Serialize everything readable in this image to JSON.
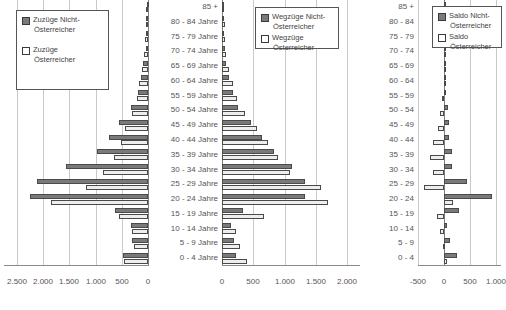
{
  "chart_data": [
    {
      "id": "zuzuege",
      "type": "bar",
      "orientation": "horizontal",
      "direction": "left",
      "title": "Zuzüge",
      "xlabel": "",
      "ylabel": "",
      "xlim": [
        0,
        2750
      ],
      "ticks": [
        2500,
        2000,
        1500,
        1000,
        500,
        0
      ],
      "ticklabels": [
        "2.500",
        "2.000",
        "1.500",
        "1.000",
        "500",
        "0"
      ],
      "grid": true,
      "legend_position": "top-left",
      "categories": [
        "85 +",
        "80 - 84 Jahre",
        "75 - 79 Jahre",
        "70 - 74 Jahre",
        "65 - 69 Jahre",
        "60 - 64 Jahre",
        "55 - 59 Jahre",
        "50 - 54 Jahre",
        "45 - 49 Jahre",
        "40 - 44 Jahre",
        "35 - 39 Jahre",
        "30 - 34 Jahre",
        "25 - 29 Jahre",
        "20 - 24 Jahre",
        "15 - 19 Jahre",
        "10 - 14 Jahre",
        "5 - 9 Jahre",
        "0 - 4 Jahre"
      ],
      "series": [
        {
          "name": "Zuzüge Nicht-Österreicher",
          "style": "dark",
          "values": [
            20,
            30,
            35,
            45,
            90,
            130,
            190,
            330,
            560,
            740,
            980,
            1560,
            2120,
            2250,
            630,
            330,
            300,
            480
          ]
        },
        {
          "name": "Zuzüge Österreicher",
          "style": "light",
          "values": [
            35,
            45,
            55,
            75,
            110,
            165,
            215,
            300,
            440,
            520,
            640,
            860,
            1190,
            1860,
            545,
            300,
            260,
            460
          ]
        }
      ]
    },
    {
      "id": "wegzuege",
      "type": "bar",
      "orientation": "horizontal",
      "direction": "right",
      "title": "Wegzüge",
      "xlabel": "",
      "ylabel": "",
      "xlim": [
        0,
        2200
      ],
      "ticks": [
        0,
        500,
        1000,
        1500,
        2000
      ],
      "ticklabels": [
        "0",
        "500",
        "1.000",
        "1.500",
        "2.000"
      ],
      "grid": true,
      "legend_position": "top-left",
      "categories": [
        "85 +",
        "80 - 84 Jahre",
        "75 - 79 Jahre",
        "70 - 74 Jahre",
        "65 - 69 Jahre",
        "60 - 64 Jahre",
        "55 - 59 Jahre",
        "50 - 54 Jahre",
        "45 - 49 Jahre",
        "40 - 44 Jahre",
        "35 - 39 Jahre",
        "30 - 34 Jahre",
        "25 - 29 Jahre",
        "20 - 24 Jahre",
        "15 - 19 Jahre",
        "10 - 14 Jahre",
        "5 - 9 Jahre",
        "0 - 4 Jahre"
      ],
      "series": [
        {
          "name": "Wegzüge Nicht-Österreicher",
          "style": "dark",
          "values": [
            15,
            25,
            30,
            40,
            70,
            110,
            170,
            260,
            460,
            640,
            830,
            1120,
            1330,
            1330,
            340,
            150,
            190,
            230
          ]
        },
        {
          "name": "Wegzüge Österreicher",
          "style": "light",
          "values": [
            30,
            40,
            50,
            70,
            105,
            175,
            245,
            370,
            560,
            740,
            900,
            1080,
            1580,
            1690,
            670,
            230,
            280,
            400
          ]
        }
      ]
    },
    {
      "id": "saldo",
      "type": "bar",
      "orientation": "horizontal",
      "direction": "right",
      "title": "Saldo",
      "xlabel": "",
      "ylabel": "",
      "xlim": [
        -500,
        1100
      ],
      "ticks": [
        -500,
        0,
        500,
        1000
      ],
      "ticklabels": [
        "-500",
        "0",
        "500",
        "1.000"
      ],
      "grid": true,
      "legend_position": "top-right",
      "categories": [
        "85 +",
        "80 - 84",
        "75 - 79",
        "70 - 74",
        "65 - 69",
        "60 - 64",
        "55 - 59",
        "50 - 54",
        "45 - 49",
        "40 - 44",
        "35 - 39",
        "30 - 34",
        "25 - 29",
        "20 - 24",
        "15 - 19",
        "10 - 14",
        "5 - 9",
        "0 - 4"
      ],
      "series": [
        {
          "name": "Saldo Nicht-Österreicher",
          "style": "dark",
          "values": [
            5,
            5,
            5,
            5,
            20,
            20,
            20,
            70,
            100,
            100,
            150,
            150,
            440,
            920,
            290,
            60,
            110,
            250
          ]
        },
        {
          "name": "Saldo Österreicher",
          "style": "light",
          "values": [
            5,
            5,
            5,
            5,
            5,
            5,
            -30,
            -70,
            -120,
            -220,
            -260,
            -220,
            -390,
            170,
            -125,
            -70,
            -20,
            60
          ]
        }
      ]
    }
  ],
  "legends": {
    "left": {
      "items": [
        {
          "style": "dark",
          "line1": "Zuzüge Nicht-",
          "line2": "Österreicher"
        },
        {
          "style": "light",
          "line1": "Zuzüge",
          "line2": "Österreicher"
        }
      ]
    },
    "middle": {
      "items": [
        {
          "style": "dark",
          "line1": "Wegzüge Nicht-",
          "line2": "Österreicher"
        },
        {
          "style": "light",
          "line1": "Wegzüge",
          "line2": "Österreicher"
        }
      ]
    },
    "right": {
      "items": [
        {
          "style": "dark",
          "line1": "Saldo Nicht-",
          "line2": "Österreicher"
        },
        {
          "style": "light",
          "line1": "Saldo",
          "line2": "Österreicher"
        }
      ]
    }
  },
  "colors": {
    "dark_series": "#7a7a7a",
    "light_series": "#eeeeee",
    "bar_border": "#4a4a4a",
    "gridline": "#c9c9c9",
    "axis": "#7d7d7d",
    "text": "#555555"
  }
}
